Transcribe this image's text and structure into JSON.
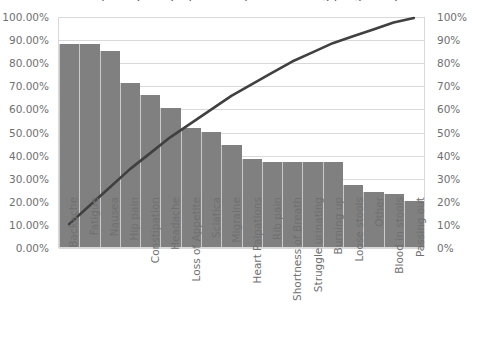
{
  "chart_data": {
    "type": "bar",
    "title": "Frequency of symptoms reported during pregnancy",
    "title_clipped": true,
    "categories": [
      "Backache",
      "Fatigue",
      "Nausea",
      "Hip pain",
      "Constipation",
      "Headache",
      "Loss of Appetite",
      "Sciatica",
      "Migraine",
      "Heart Palpations",
      "Rib pain",
      "Shortness of Breath",
      "Struggle urinating",
      "Burning up",
      "Loose stools",
      "Other",
      "Blood in stools",
      "Passing out"
    ],
    "series": [
      {
        "name": "Frequency",
        "axis": "left",
        "values": [
          88.0,
          88.0,
          85.0,
          71.0,
          66.0,
          60.0,
          51.5,
          50.0,
          44.0,
          38.0,
          37.0,
          37.0,
          37.0,
          37.0,
          27.0,
          24.0,
          23.0,
          20.0
        ]
      },
      {
        "name": "Cumulative %",
        "axis": "right",
        "values": [
          10.0,
          18.0,
          26.0,
          34.0,
          41.0,
          48.0,
          54.0,
          60.0,
          66.0,
          71.0,
          76.0,
          81.0,
          85.0,
          89.0,
          92.0,
          95.0,
          98.0,
          100.0
        ]
      }
    ],
    "xlabel": "",
    "ylabel": "",
    "ylim": [
      0,
      100
    ],
    "y2lim": [
      0,
      100
    ],
    "grid": true,
    "legend": "none",
    "bar_color": "#808080",
    "line_color": "#404040",
    "grid_color": "#d9d9d9"
  },
  "axis_left": {
    "name": "primary-percentage-axis",
    "ticks": [
      "100.00%",
      "90.00%",
      "80.00%",
      "70.00%",
      "60.00%",
      "50.00%",
      "40.00%",
      "30.00%",
      "20.00%",
      "10.00%",
      "0.00%"
    ]
  },
  "axis_right": {
    "name": "cumulative-percentage-axis",
    "ticks": [
      "100%",
      "90%",
      "80%",
      "70%",
      "60%",
      "50%",
      "40%",
      "30%",
      "20%",
      "10%",
      "0%"
    ]
  }
}
